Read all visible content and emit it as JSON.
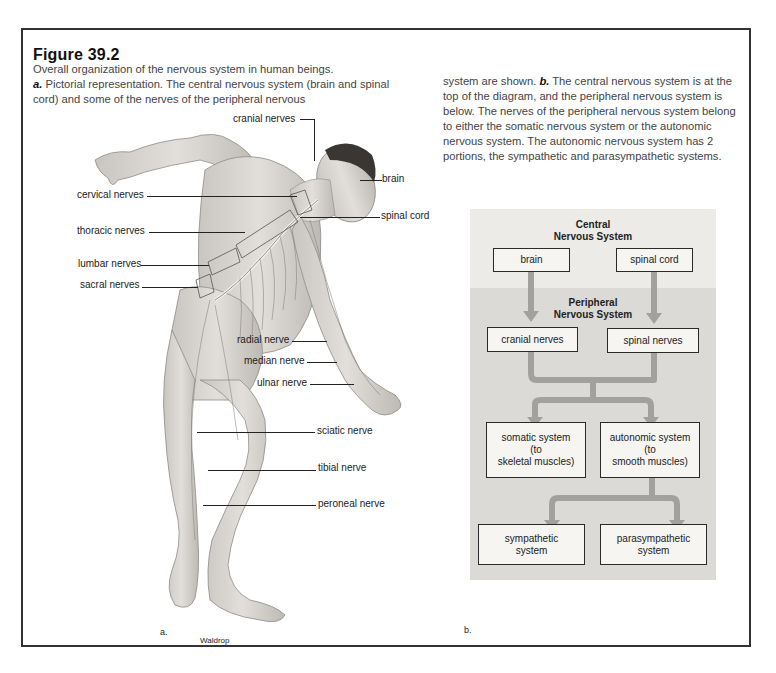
{
  "figure": {
    "title": "Figure 39.2",
    "caption_left": {
      "line1": "Overall organization of the nervous system in human beings.",
      "a_marker": "a.",
      "a_text": " Pictorial representation. The central nervous system (brain and spinal cord) and some of the nerves of the peripheral nervous"
    },
    "caption_right": {
      "pre": "system are shown. ",
      "b_marker": "b.",
      "b_text": " The central nervous system is at the top of the diagram, and the peripheral nervous system is below. The nerves of the peripheral nervous system belong to either the somatic nervous system or the autonomic nervous system. The autonomic nervous system has 2 portions, the sympathetic and parasympathetic systems."
    }
  },
  "panel_a": {
    "sublabel": "a.",
    "credit": "Waldrop",
    "labels": {
      "cranial_nerves": "cranial nerves",
      "brain": "brain",
      "cervical_nerves": "cervical nerves",
      "spinal_cord": "spinal cord",
      "thoracic_nerves": "thoracic nerves",
      "lumbar_nerves": "lumbar nerves",
      "sacral_nerves": "sacral nerves",
      "radial_nerve": "radial nerve",
      "median_nerve": "median nerve",
      "ulnar_nerve": "ulnar nerve",
      "sciatic_nerve": "sciatic nerve",
      "tibial_nerve": "tibial nerve",
      "peroneal_nerve": "peroneal nerve"
    }
  },
  "panel_b": {
    "sublabel": "b.",
    "central_title_1": "Central",
    "central_title_2": "Nervous System",
    "peripheral_title_1": "Peripheral",
    "peripheral_title_2": "Nervous System",
    "boxes": {
      "brain": "brain",
      "spinal_cord": "spinal cord",
      "cranial_nerves": "cranial nerves",
      "spinal_nerves": "spinal nerves",
      "somatic_1": "somatic system",
      "somatic_2": "(to",
      "somatic_3": "skeletal muscles)",
      "autonomic_1": "autonomic system",
      "autonomic_2": "(to",
      "autonomic_3": "smooth muscles)",
      "sympathetic_1": "sympathetic",
      "sympathetic_2": "system",
      "parasympathetic_1": "parasympathetic",
      "parasympathetic_2": "system"
    },
    "colors": {
      "central_bg": "#ecebe8",
      "peripheral_bg": "#dcdad6",
      "arrow": "#a3a19d",
      "box_bg": "#f6f5f2",
      "box_border": "#2a2a2a"
    }
  }
}
